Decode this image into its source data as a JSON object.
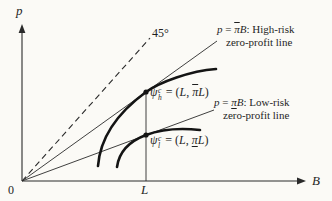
{
  "colors": {
    "ink": "#1f1f1f",
    "bg": "#fbfaf6"
  },
  "axes": {
    "y_label": "p",
    "x_label": "B",
    "origin_label": "0",
    "l_tick_label": "L"
  },
  "angle_label": "45°",
  "high_risk_label": {
    "p": "p",
    "eq": " = ",
    "pi": "π",
    "B": "B",
    "tail": ":  High-risk",
    "line2": "zero-profit line"
  },
  "low_risk_label": {
    "p": "p",
    "eq": " = ",
    "pi": "π",
    "B": "B",
    "tail": ":  Low-risk",
    "line2": "zero-profit line"
  },
  "point_high_label": {
    "psi": "ψ",
    "sup": "c",
    "sub": "h",
    "eq": " = (",
    "L_open": "L",
    "comma": ", ",
    "pi": "π",
    "L_close": "L",
    "close": ")"
  },
  "point_low_label": {
    "psi": "ψ",
    "sup": "c",
    "sub": "l",
    "eq": " = (",
    "L_open": "L",
    "comma": ", ",
    "pi": "π",
    "L_close": "L",
    "close": ")"
  }
}
